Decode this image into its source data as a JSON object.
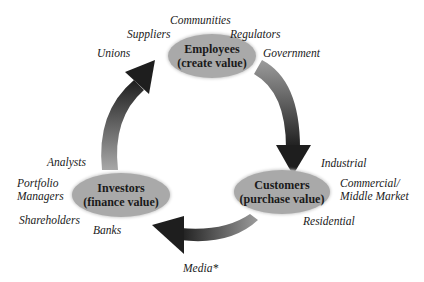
{
  "diagram": {
    "nodes": {
      "employees": {
        "title": "Employees",
        "subtitle": "(create value)"
      },
      "customers": {
        "title": "Customers",
        "subtitle": "(purchase value)"
      },
      "investors": {
        "title": "Investors",
        "subtitle": "(finance value)"
      }
    },
    "stakeholders": {
      "communities": "Communities",
      "suppliers": "Suppliers",
      "regulators": "Regulators",
      "unions": "Unions",
      "government": "Government",
      "industrial": "Industrial",
      "commercial_line1": "Commercial/",
      "commercial_line2": "Middle Market",
      "residential": "Residential",
      "analysts": "Analysts",
      "portfolio_line1": "Portfolio",
      "portfolio_line2": "Managers",
      "shareholders": "Shareholders",
      "banks": "Banks",
      "media": "Media*"
    },
    "colors": {
      "node_fill": "#a9a9a9",
      "arrow_dark": "#1e1e1e",
      "arrow_light": "#9a9a9a"
    }
  }
}
